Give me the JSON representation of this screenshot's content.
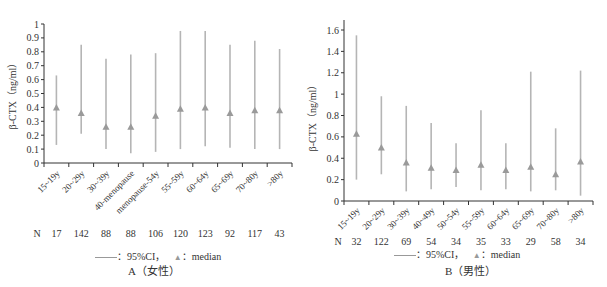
{
  "chart_data": [
    {
      "type": "errorbar",
      "panel": "A",
      "title": "A（女性）",
      "xlabel": "",
      "ylabel": "β-CTX（ng/ml）",
      "ylim": [
        0,
        1
      ],
      "yticks": [
        "0",
        "0.1",
        "0.2",
        "0.3",
        "0.4",
        "0.5",
        "0.6",
        "0.7",
        "0.8",
        "0.9",
        "1"
      ],
      "grid": false,
      "categories": [
        "15~19y",
        "20~29y",
        "30~39y",
        "40-menopause",
        "menopause-54y",
        "55~59y",
        "60~64y",
        "65~69y",
        "70~80y",
        ">80y"
      ],
      "n_label": "N",
      "n": [
        17,
        142,
        88,
        88,
        106,
        120,
        123,
        92,
        117,
        43
      ],
      "series": [
        {
          "name": "median",
          "values": [
            0.4,
            0.36,
            0.26,
            0.26,
            0.34,
            0.39,
            0.4,
            0.36,
            0.38,
            0.38
          ]
        },
        {
          "name": "95%CI lower",
          "values": [
            0.13,
            0.21,
            0.1,
            0.07,
            0.08,
            0.1,
            0.12,
            0.11,
            0.1,
            0.1
          ]
        },
        {
          "name": "95%CI upper",
          "values": [
            0.63,
            0.85,
            0.75,
            0.78,
            0.79,
            0.95,
            0.95,
            0.85,
            0.88,
            0.82
          ]
        }
      ],
      "legend": {
        "ci": "：95%CI，",
        "median": "：median",
        "position": "bottom"
      }
    },
    {
      "type": "errorbar",
      "panel": "B",
      "title": "B（男性）",
      "xlabel": "",
      "ylabel": "β-CTX（ng/ml）",
      "ylim": [
        0,
        1.7
      ],
      "yticks": [
        "0",
        "0.2",
        "0.4",
        "0.6",
        "0.8",
        "1",
        "1.2",
        "1.4",
        "1.6"
      ],
      "grid": false,
      "categories": [
        "15~19y",
        "20~29y",
        "30~39y",
        "40~49y",
        "50~54y",
        "55~59y",
        "60~64y",
        "65~69y",
        "70~80y",
        ">80y"
      ],
      "n_label": "N",
      "n": [
        32,
        122,
        69,
        54,
        34,
        35,
        33,
        29,
        58,
        34
      ],
      "series": [
        {
          "name": "median",
          "values": [
            0.63,
            0.5,
            0.36,
            0.31,
            0.29,
            0.34,
            0.29,
            0.32,
            0.25,
            0.37
          ]
        },
        {
          "name": "95%CI lower",
          "values": [
            0.2,
            0.25,
            0.09,
            0.11,
            0.13,
            0.1,
            0.11,
            0.09,
            0.1,
            0.05
          ]
        },
        {
          "name": "95%CI upper",
          "values": [
            1.55,
            0.98,
            0.89,
            0.73,
            0.54,
            0.85,
            0.54,
            1.21,
            0.68,
            1.22
          ]
        }
      ],
      "legend": {
        "ci": "：95%CI，",
        "median": "：median",
        "position": "bottom"
      }
    }
  ],
  "colors": {
    "axis": "#333333",
    "bar": "#b5b5b5",
    "marker": "#9a9a9a",
    "text": "#333333"
  }
}
